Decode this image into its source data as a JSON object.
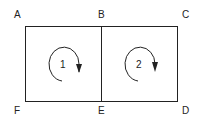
{
  "diagram": {
    "corners": {
      "A": "A",
      "B": "B",
      "C": "C",
      "D": "D",
      "E": "E",
      "F": "F"
    },
    "loops": [
      {
        "label": "1",
        "direction": "clockwise"
      },
      {
        "label": "2",
        "direction": "clockwise"
      }
    ],
    "colors": {
      "stroke": "#222222",
      "background": "#ffffff"
    }
  }
}
